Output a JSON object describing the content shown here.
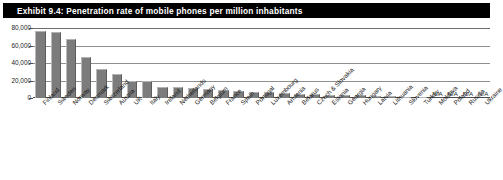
{
  "exhibit": {
    "title": "Exhibit 9.4: Penetration rate of mobile phones per million inhabitants"
  },
  "colors": {
    "title_bar_background": "#000000",
    "title_text": "#ffffff",
    "bar_fill": "#7c7c7c",
    "gridline": "#8f8f8f",
    "axis": "#4a4a4a",
    "page_background": "#ffffff"
  },
  "chart_data": {
    "type": "bar",
    "title": "Exhibit 9.4: Penetration rate of mobile phones per million inhabitants",
    "xlabel": "",
    "ylabel": "",
    "ylim": [
      0,
      80000
    ],
    "yticks": [
      0,
      20000,
      40000,
      60000,
      80000
    ],
    "ytick_labels": [
      "0",
      "20,000",
      "40,000",
      "60,000",
      "80,000"
    ],
    "grid": true,
    "legend": "none",
    "na_label": "N/A",
    "categories": [
      "Finland",
      "Sweden",
      "Norway",
      "Denmark",
      "Switzerland",
      "Austria",
      "UK",
      "Italy",
      "Ireland",
      "Netherlands",
      "Germany",
      "Belgium",
      "France",
      "Spain",
      "Portugal",
      "Luxembourg",
      "Armenia",
      "Belarus",
      "Czech & Slovakia",
      "Estonia",
      "Georgia",
      "Hungary",
      "Latvia",
      "Lithuania",
      "Slovenia",
      "Turkey",
      "Moldova",
      "Poland",
      "Russia",
      "Ukraine"
    ],
    "values": [
      77000,
      76000,
      68000,
      47000,
      33000,
      27000,
      19000,
      19000,
      13000,
      12500,
      12000,
      10500,
      9000,
      7500,
      7000,
      6500,
      5500,
      5000,
      4500,
      4000,
      3500,
      3000,
      2500,
      2000,
      1500,
      1200,
      null,
      null,
      null,
      null
    ],
    "value_labels": [
      "",
      "",
      "",
      "",
      "",
      "",
      "",
      "",
      "",
      "",
      "",
      "",
      "",
      "",
      "",
      "",
      "",
      "",
      "",
      "",
      "",
      "",
      "",
      "",
      "",
      "",
      "N/A",
      "N/A",
      "N/A",
      "N/A"
    ]
  }
}
